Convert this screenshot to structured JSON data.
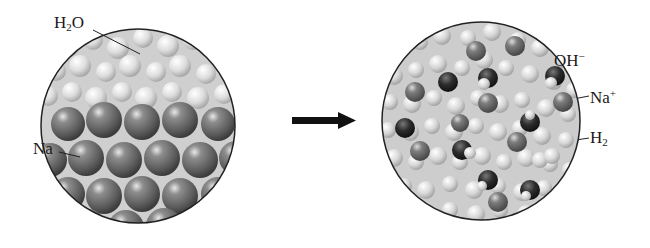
{
  "diagram": {
    "before": {
      "labels": [
        {
          "id": "water",
          "base": "H",
          "sub": "2",
          "tail": "O",
          "text": "H2O"
        },
        {
          "id": "sodium",
          "base": "Na",
          "text": "Na"
        }
      ]
    },
    "arrow": {
      "direction": "right",
      "color": "#111111"
    },
    "after": {
      "labels": [
        {
          "id": "hydroxide",
          "base": "OH",
          "sup": "−",
          "text": "OH−"
        },
        {
          "id": "sodium-ion",
          "base": "Na",
          "sup": "+",
          "text": "Na+"
        },
        {
          "id": "hydrogen",
          "base": "H",
          "sub": "2",
          "text": "H2"
        }
      ]
    },
    "colors": {
      "outline": "#222222",
      "water": "#d8d8d8",
      "sodium": "#6e6e6e",
      "hydroxide": "#2a2a2a",
      "ion": "#7a7a7a"
    }
  }
}
